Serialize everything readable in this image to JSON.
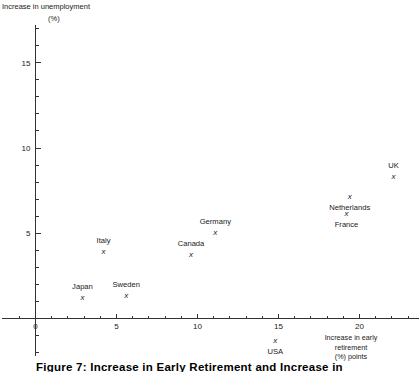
{
  "caption": "Figure 7:   Increase in Early Retirement and Increase in",
  "axes": {
    "ylabel_line1": "Increase in unemployment",
    "ylabel_line2": "(%)",
    "xlabel_line1": "Increase in early",
    "xlabel_line2": "retirement",
    "xlabel_line3": "(%) points"
  },
  "chart_data": {
    "type": "scatter",
    "title": "Figure 7:   Increase in Early Retirement and Increase in",
    "xlabel": "Increase in early retirement (%) points",
    "ylabel": "Increase in unemployment (%)",
    "xlim": [
      -1.2,
      23.5
    ],
    "ylim": [
      -2.2,
      17.2
    ],
    "xticks": [
      0,
      5,
      10,
      15,
      20
    ],
    "yticks": [
      5,
      10,
      15
    ],
    "xtick_labels": [
      "0",
      "5",
      "10",
      "15",
      "20"
    ],
    "ytick_labels": [
      "5",
      "10",
      "15"
    ],
    "x_minor_tick_step": 1,
    "y_minor_tick_step": 1,
    "grid": false,
    "legend": false,
    "marker": "x",
    "points": [
      {
        "name": "Japan",
        "x": 2.9,
        "y": 1.2,
        "label_dx": 0,
        "label_dy": -11
      },
      {
        "name": "Sweden",
        "x": 5.6,
        "y": 1.3,
        "label_dx": 0,
        "label_dy": -11
      },
      {
        "name": "Italy",
        "x": 4.2,
        "y": 3.9,
        "label_dx": 0,
        "label_dy": -11
      },
      {
        "name": "Canada",
        "x": 9.6,
        "y": 3.7,
        "label_dx": 0,
        "label_dy": -11
      },
      {
        "name": "Germany",
        "x": 11.1,
        "y": 5.0,
        "label_dx": 0,
        "label_dy": -11
      },
      {
        "name": "France",
        "x": 19.2,
        "y": 6.1,
        "label_dx": 0,
        "label_dy": 11
      },
      {
        "name": "Netherlands",
        "x": 19.4,
        "y": 7.1,
        "label_dx": 0,
        "label_dy": 11
      },
      {
        "name": "UK",
        "x": 22.1,
        "y": 8.3,
        "label_dx": 0,
        "label_dy": -11
      },
      {
        "name": "USA",
        "x": 14.8,
        "y": -1.3,
        "label_dx": 0,
        "label_dy": 11
      }
    ]
  }
}
